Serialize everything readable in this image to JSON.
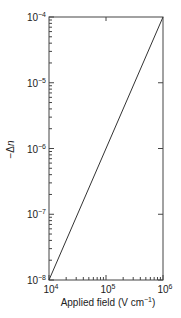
{
  "chart_data": {
    "type": "line",
    "title": "",
    "xlabel": "Applied field (V cm⁻¹)",
    "ylabel": "−Δn",
    "xscale": "log",
    "yscale": "log",
    "xlim": [
      10000,
      1000000
    ],
    "ylim": [
      1e-08,
      0.0001
    ],
    "x_tick_labels": [
      {
        "value": 10000,
        "base": "10",
        "exp": "4"
      },
      {
        "value": 100000,
        "base": "10",
        "exp": "5"
      },
      {
        "value": 1000000,
        "base": "10",
        "exp": "6"
      }
    ],
    "y_tick_labels": [
      {
        "value": 0.0001,
        "base": "10",
        "exp": "-4"
      },
      {
        "value": 1e-05,
        "base": "10",
        "exp": "-5"
      },
      {
        "value": 1e-06,
        "base": "10",
        "exp": "-6"
      },
      {
        "value": 1e-07,
        "base": "10",
        "exp": "-7"
      },
      {
        "value": 1e-08,
        "base": "10",
        "exp": "-8"
      }
    ],
    "grid": false,
    "legend": null,
    "series": [
      {
        "name": "-Δn",
        "x": [
          10000,
          1000000
        ],
        "y": [
          1e-08,
          0.0001
        ],
        "color": "#333333"
      }
    ]
  }
}
